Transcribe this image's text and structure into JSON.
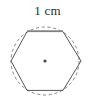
{
  "figure": {
    "label": {
      "text": "1 cm",
      "value": "1",
      "unit": "cm",
      "describes": "top-side-of-hexagon"
    },
    "colors": {
      "hexagon_stroke": "#555555",
      "circle_stroke": "#7a7a7a",
      "highlight_stroke": "#8a8a8a",
      "center_dot": "#4a4a4a",
      "label_text": "#2b2b2b",
      "background": "#ffffff"
    },
    "circle": {
      "shape": "circle",
      "style": "dashed",
      "center_x": 45,
      "center_y": 61,
      "radius": 34
    },
    "center_point": {
      "shape": "dot",
      "x": 45,
      "y": 61,
      "radius": 1.6
    },
    "hexagon": {
      "shape": "regular-hexagon",
      "sides": 6,
      "orientation": "flat-top",
      "style": "solid",
      "points": "27.0,31.6 63.0,31.6 81.0,61.0 63.0,90.4 27.0,90.4 11.0,61.0",
      "vertices": [
        {
          "name": "top-left",
          "x": 27.0,
          "y": 31.6
        },
        {
          "name": "top-right",
          "x": 63.0,
          "y": 31.6
        },
        {
          "name": "right",
          "x": 81.0,
          "y": 61.0
        },
        {
          "name": "bottom-right",
          "x": 63.0,
          "y": 90.4
        },
        {
          "name": "bottom-left",
          "x": 27.0,
          "y": 90.4
        },
        {
          "name": "left",
          "x": 11.0,
          "y": 61.0
        }
      ]
    },
    "measured_side": {
      "name": "top-edge",
      "x1": 27.0,
      "y1": 31.0,
      "x2": 63.0,
      "y2": 31.0
    }
  }
}
